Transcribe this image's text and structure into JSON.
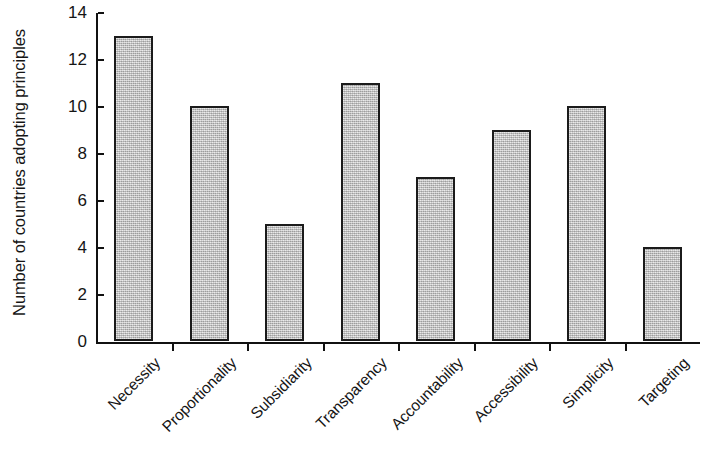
{
  "chart_data": {
    "type": "bar",
    "title": "",
    "subtitle": "",
    "xlabel": "",
    "ylabel": "Number of countries adopting principles",
    "categories": [
      "Necessity",
      "Proportionality",
      "Subsidiarity",
      "Transparency",
      "Accountability",
      "Accessibility",
      "Simplicity",
      "Targeting"
    ],
    "values": [
      13,
      10,
      5,
      11,
      7,
      9,
      10,
      4
    ],
    "ylim": [
      0,
      14
    ],
    "y_ticks": [
      0,
      2,
      4,
      6,
      8,
      10,
      12,
      14
    ],
    "y_tick_labels": [
      "0",
      "2",
      "4",
      "6",
      "8",
      "10",
      "12",
      "14"
    ],
    "grid": false,
    "legend": null,
    "legend_position": "none",
    "bar_fill_color": "#c3c3c3",
    "bar_edge_color": "#1b1b1b",
    "axis_color": "#111111",
    "background_color": "#ffffff",
    "x_label_rotation": -45
  }
}
